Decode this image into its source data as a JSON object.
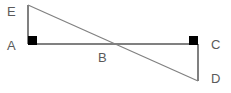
{
  "figure": {
    "background_color": "#ffffff",
    "stroke_color": "#808080",
    "label_color": "#5a5a5a",
    "right_angle_marker_color": "#000000",
    "stroke_width": 1.2,
    "labels": {
      "E": "E",
      "A": "A",
      "B": "B",
      "C": "C",
      "D": "D"
    },
    "points": {
      "E": {
        "x": 28,
        "y": 5
      },
      "A": {
        "x": 28,
        "y": 44
      },
      "B": {
        "x": 105,
        "y": 44
      },
      "C": {
        "x": 198,
        "y": 44
      },
      "D": {
        "x": 198,
        "y": 81
      }
    },
    "segments": [
      {
        "name": "EA",
        "from": "E",
        "to": "A"
      },
      {
        "name": "AC",
        "from": "A",
        "to": "C"
      },
      {
        "name": "CD",
        "from": "C",
        "to": "D"
      },
      {
        "name": "ED",
        "from": "E",
        "to": "D"
      }
    ],
    "right_angles": [
      {
        "at": "A",
        "x": 28,
        "y": 36,
        "size": 9
      },
      {
        "at": "C",
        "x": 189,
        "y": 36,
        "size": 9
      }
    ]
  }
}
